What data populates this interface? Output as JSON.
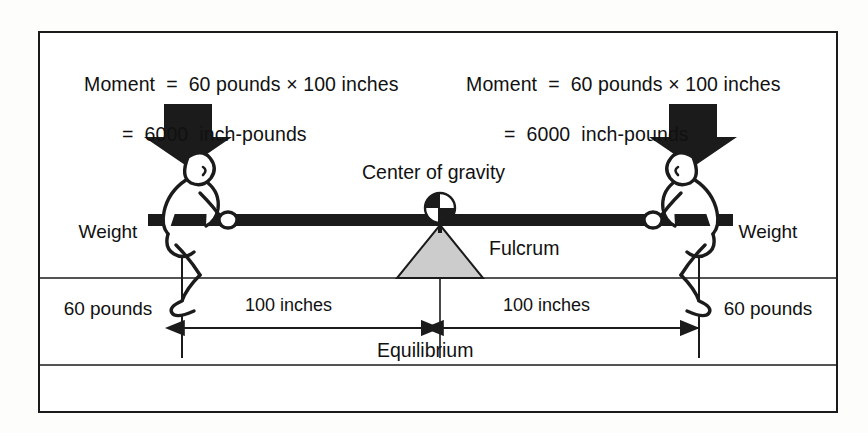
{
  "figure": {
    "colors": {
      "ink": "#1b1b1b",
      "beam": "#1b1b1b",
      "arrow": "#1b1b1b",
      "fulcrum_fill": "#c9c9c9",
      "paper": "#ffffff"
    }
  },
  "moment_left": {
    "line1": "Moment  =  60 pounds × 100 inches",
    "line2": "=  6000  inch-pounds"
  },
  "moment_right": {
    "line1": "Moment  =  60 pounds × 100 inches",
    "line2": "=  6000  inch-pounds"
  },
  "weight_left": {
    "line1": "Weight",
    "line2": "60 pounds"
  },
  "weight_right": {
    "line1": "Weight",
    "line2": "60 pounds"
  },
  "center_of_gravity_label": "Center of gravity",
  "fulcrum_label": "Fulcrum",
  "dimensions": {
    "left": "100 inches",
    "right": "100 inches",
    "caption": "Equilibrium"
  },
  "icons": {
    "load_arrow_left": "down-arrow-icon",
    "load_arrow_right": "down-arrow-icon",
    "cg_symbol": "center-of-gravity-icon",
    "fulcrum": "fulcrum-triangle-icon",
    "person_left": "person-sitting-icon",
    "person_right": "person-sitting-icon"
  }
}
